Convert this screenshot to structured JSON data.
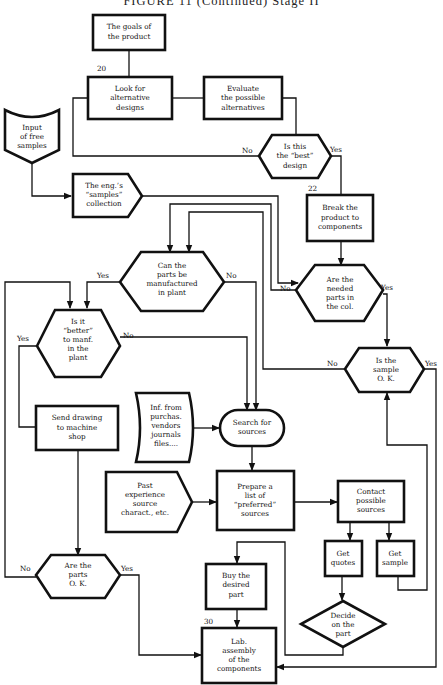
{
  "title": "FIGURE 11 (Continued) Stage II",
  "step_numbers": {
    "n20": "20",
    "n22": "22",
    "n30": "30"
  },
  "nodes": {
    "goals": [
      "The goals of",
      "the product"
    ],
    "look_alt": [
      "Look for",
      "alternative",
      "designs"
    ],
    "evaluate": [
      "Evaluate",
      "the possible",
      "alternatives"
    ],
    "input_samples": [
      "Input",
      "of free",
      "samples"
    ],
    "best_design": [
      "Is this",
      "the “best”",
      "design"
    ],
    "samples_collection": [
      "The eng.’s",
      "“samples”",
      "collection"
    ],
    "break_product": [
      "Break the",
      "product to",
      "components"
    ],
    "can_manufacture": [
      "Can the",
      "parts  be",
      "manufactured",
      "in plant"
    ],
    "needed_parts": [
      "Are the",
      "needed",
      "parts  in",
      "the  col."
    ],
    "better_manf": [
      "Is it",
      "“better”",
      "to manf.",
      "in the",
      "plant"
    ],
    "sample_ok": [
      "Is the",
      "sample",
      "O. K."
    ],
    "send_drawing": [
      "Send drawing",
      "to machine",
      "shop"
    ],
    "inf_purchas": [
      "Inf. from",
      "purchas.",
      "vendors",
      "journals",
      "files...."
    ],
    "search_sources": [
      "Search for",
      "sources"
    ],
    "past_experience": [
      "Past",
      "experience",
      "source",
      "charact., etc."
    ],
    "prepare_list": [
      "Prepare a",
      "list of",
      "“preferred”",
      "sources"
    ],
    "contact_sources": [
      "Contact",
      "possible",
      "sources"
    ],
    "get_quotes": [
      "Get",
      "quotes"
    ],
    "get_sample": [
      "Get",
      "sample"
    ],
    "parts_ok": [
      "Are the",
      "parts",
      "O. K."
    ],
    "buy_part": [
      "Buy the",
      "desired",
      "part"
    ],
    "decide_part": [
      "Decide",
      "on the",
      "part"
    ],
    "lab_assembly": [
      "Lab.",
      "assembly",
      "of the",
      "components"
    ]
  },
  "edge_labels": {
    "best_no": "No",
    "best_yes": "Yes",
    "manuf_yes": "Yes",
    "manuf_no": "No",
    "needed_no": "No",
    "needed_yes": "Yes",
    "better_yes": "Yes",
    "better_no": "No",
    "sample_no": "No",
    "sample_yes": "Yes",
    "parts_no": "No",
    "parts_yes": "Yes"
  }
}
